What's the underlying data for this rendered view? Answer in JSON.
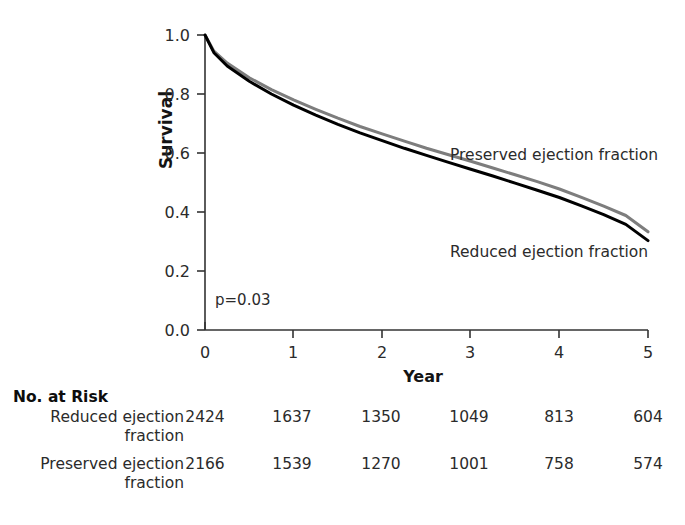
{
  "figure": {
    "axes": {
      "y_title": "Survival",
      "x_title": "Year",
      "y_ticks": [
        "1.0",
        "0.8",
        "0.6",
        "0.4",
        "0.2",
        "0.0"
      ],
      "x_ticks": [
        "0",
        "1",
        "2",
        "3",
        "4",
        "5"
      ]
    },
    "annotations": {
      "p_value": "p=0.03",
      "label_preserved": "Preserved ejection fraction",
      "label_reduced": "Reduced ejection fraction"
    },
    "colors": {
      "preserved": "#7d7d7d",
      "reduced": "#000000",
      "axis": "#333333",
      "text": "#2b2b2b"
    },
    "risk_table": {
      "title": "No. at Risk",
      "rows": [
        {
          "label_line1": "Reduced ejection",
          "label_line2": "fraction",
          "values": [
            "2424",
            "1637",
            "1350",
            "1049",
            "813",
            "604"
          ]
        },
        {
          "label_line1": "Preserved ejection",
          "label_line2": "fraction",
          "values": [
            "2166",
            "1539",
            "1270",
            "1001",
            "758",
            "574"
          ]
        }
      ]
    }
  },
  "chart_data": {
    "type": "line",
    "title": "",
    "subtitle": "",
    "xlabel": "Year",
    "ylabel": "Survival",
    "xlim": [
      0,
      5
    ],
    "ylim": [
      0.0,
      1.0
    ],
    "xticks": [
      0,
      1,
      2,
      3,
      4,
      5
    ],
    "yticks": [
      0.0,
      0.2,
      0.4,
      0.6,
      0.8,
      1.0
    ],
    "grid": false,
    "legend": "inline-curve-labels",
    "annotations": [
      {
        "text": "p=0.03",
        "x": 0.1,
        "y": 0.12
      },
      {
        "text": "Preserved ejection fraction",
        "x": 3.35,
        "y": 0.62
      },
      {
        "text": "Reduced ejection fraction",
        "x": 3.35,
        "y": 0.29
      }
    ],
    "x": [
      0,
      0.1,
      0.25,
      0.5,
      0.75,
      1.0,
      1.25,
      1.5,
      1.75,
      2.0,
      2.25,
      2.5,
      2.75,
      3.0,
      3.25,
      3.5,
      3.75,
      4.0,
      4.25,
      4.5,
      4.75,
      5.0
    ],
    "series": [
      {
        "name": "Preserved ejection fraction",
        "color": "#7d7d7d",
        "values": [
          1.0,
          0.945,
          0.905,
          0.855,
          0.815,
          0.78,
          0.748,
          0.718,
          0.69,
          0.665,
          0.64,
          0.616,
          0.594,
          0.572,
          0.549,
          0.526,
          0.503,
          0.478,
          0.45,
          0.42,
          0.388,
          0.333
        ]
      },
      {
        "name": "Reduced ejection fraction",
        "color": "#000000",
        "values": [
          1.0,
          0.94,
          0.895,
          0.843,
          0.8,
          0.762,
          0.728,
          0.697,
          0.668,
          0.642,
          0.616,
          0.592,
          0.568,
          0.545,
          0.522,
          0.498,
          0.474,
          0.449,
          0.421,
          0.391,
          0.358,
          0.303
        ]
      }
    ],
    "risk_table": {
      "times": [
        0,
        1,
        2,
        3,
        4,
        5
      ],
      "rows": [
        {
          "name": "Reduced ejection fraction",
          "counts": [
            2424,
            1637,
            1350,
            1049,
            813,
            604
          ]
        },
        {
          "name": "Preserved ejection fraction",
          "counts": [
            2166,
            1539,
            1270,
            1001,
            758,
            574
          ]
        }
      ]
    }
  }
}
